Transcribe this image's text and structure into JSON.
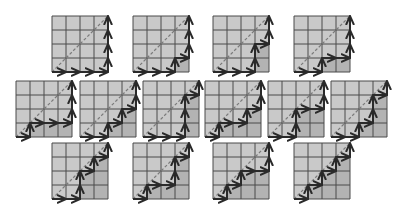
{
  "grid_size": 4,
  "cell_px": 14,
  "colors": {
    "background": "#ffffff",
    "cell": "#c9c9c9",
    "shaded_cell": "#b3b3b3",
    "grid_line": "#4a4a4a",
    "path": "#2a2a2a",
    "diagonal": "#7a7a7a"
  },
  "diagrams": [
    {
      "x": 52,
      "y": 16,
      "path": "RRRRUUUU"
    },
    {
      "x": 133,
      "y": 16,
      "path": "RRRURUUU"
    },
    {
      "x": 213,
      "y": 16,
      "path": "RRRUURUU"
    },
    {
      "x": 294,
      "y": 16,
      "path": "RRURRUUU"
    },
    {
      "x": 16,
      "y": 81,
      "path": "RURRRUUU"
    },
    {
      "x": 80,
      "y": 81,
      "path": "RRURURUU"
    },
    {
      "x": 143,
      "y": 81,
      "path": "RRRUUURU"
    },
    {
      "x": 205,
      "y": 81,
      "path": "RURRURUU"
    },
    {
      "x": 268,
      "y": 81,
      "path": "RRUURRUU"
    },
    {
      "x": 331,
      "y": 81,
      "path": "RRURUURU"
    },
    {
      "x": 52,
      "y": 143,
      "path": "RRUURURU"
    },
    {
      "x": 133,
      "y": 143,
      "path": "RURRUURU"
    },
    {
      "x": 213,
      "y": 143,
      "path": "RURURRUU"
    },
    {
      "x": 294,
      "y": 143,
      "path": "RURURURU"
    }
  ]
}
